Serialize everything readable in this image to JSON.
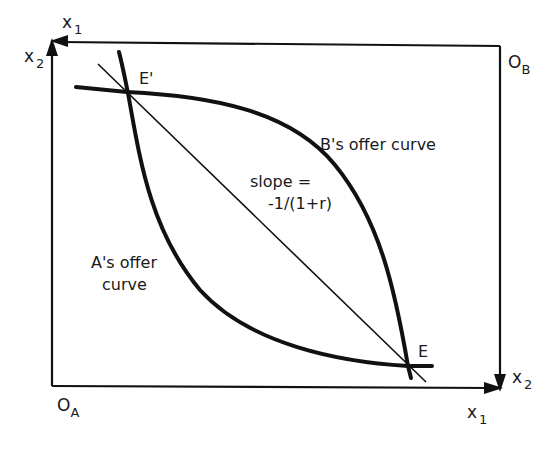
{
  "diagram": {
    "type": "edgeworth-box",
    "origins": {
      "a": {
        "label": "O",
        "subscript": "A"
      },
      "b": {
        "label": "O",
        "subscript": "B"
      }
    },
    "axes": {
      "a_x": {
        "label": "x",
        "subscript": "1"
      },
      "a_y": {
        "label": "x",
        "subscript": "2"
      },
      "b_x": {
        "label": "x",
        "subscript": "1"
      },
      "b_y": {
        "label": "x",
        "subscript": "2"
      }
    },
    "points": {
      "e": "E",
      "e_prime": "E'"
    },
    "curves": {
      "a_offer_line1": "A's offer",
      "a_offer_line2": "curve",
      "b_offer": "B's offer curve"
    },
    "budget_line": {
      "line1": "slope =",
      "line2": "-1/(1+r)"
    },
    "colors": {
      "ink": "#111111",
      "background": "#ffffff"
    }
  }
}
